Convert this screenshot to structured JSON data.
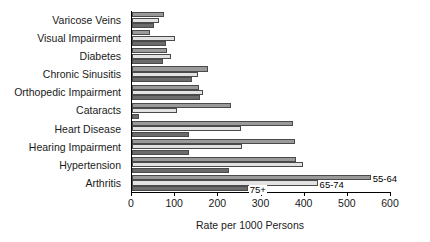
{
  "chart_data": {
    "type": "bar",
    "orientation": "horizontal",
    "title": "",
    "xlabel": "Rate per 1000 Persons",
    "ylabel": "",
    "xlim": [
      0,
      600
    ],
    "xticks": [
      0,
      100,
      200,
      300,
      400,
      500,
      600
    ],
    "grid": false,
    "legend_position": "inline-callouts",
    "categories": [
      "Varicose Veins",
      "Visual Impairment",
      "Diabetes",
      "Chronic Sinusitis",
      "Orthopedic Impairment",
      "Cataracts",
      "Heart Disease",
      "Hearing Impairment",
      "Hypertension",
      "Arthritis"
    ],
    "series": [
      {
        "name": "55-64",
        "color": "#9a9a9a",
        "values": [
          75,
          42,
          82,
          177,
          155,
          230,
          372,
          378,
          380,
          553
        ]
      },
      {
        "name": "65-74",
        "color": "#e2e2e2",
        "values": [
          62,
          100,
          90,
          152,
          165,
          105,
          252,
          255,
          395,
          430
        ]
      },
      {
        "name": "75+",
        "color": "#6b6b6b",
        "values": [
          50,
          78,
          72,
          140,
          158,
          17,
          132,
          133,
          225,
          268
        ]
      }
    ],
    "annotations": [
      {
        "text": "55-64",
        "series": "55-64",
        "category": "Arthritis"
      },
      {
        "text": "65-74",
        "series": "65-74",
        "category": "Arthritis"
      },
      {
        "text": "75+",
        "series": "75+",
        "category": "Arthritis"
      }
    ]
  }
}
